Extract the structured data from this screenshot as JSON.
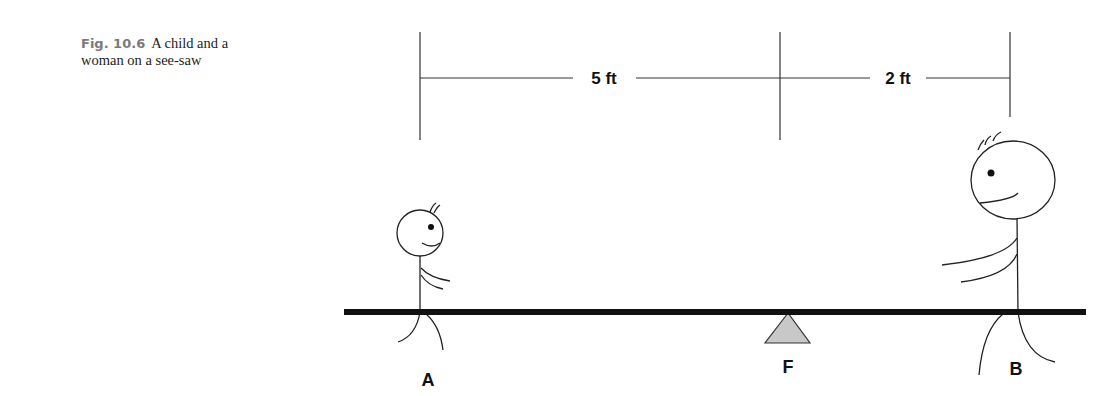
{
  "caption": {
    "figure_number": "Fig. 10.6",
    "text_line1": "A child and a",
    "text_line2": "woman on a see-saw"
  },
  "dimensions": [
    {
      "label": "5 ft",
      "from": "A",
      "to": "F"
    },
    {
      "label": "2 ft",
      "from": "F",
      "to": "B"
    }
  ],
  "points": {
    "A": "A",
    "F": "F",
    "B": "B"
  },
  "figures": {
    "child": {
      "position": "A",
      "description": "child"
    },
    "woman": {
      "position": "B",
      "description": "woman"
    }
  },
  "colors": {
    "line": "#222222",
    "beam": "#111111",
    "fulcrum_fill": "#c8c8c8"
  }
}
